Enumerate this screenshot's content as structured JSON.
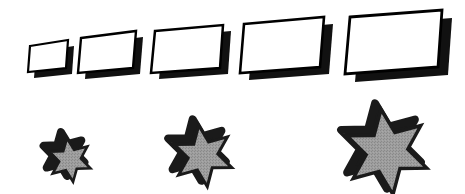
{
  "figure": {
    "background_color": "#ffffff",
    "width": 465,
    "height": 194,
    "outline_color": "#000000",
    "shadow_color": "#111111",
    "parallelogram_fill": "#ffffff",
    "star_fill": "#9a9a9a",
    "star_fill_texture": "#8d8d8d"
  },
  "rows": [
    {
      "name": "parallelogram-row",
      "label": "Row of five parallelograms",
      "shape_type": "parallelogram",
      "count": 5,
      "fill": "#ffffff",
      "stroke": "#000000",
      "shadow_offset_x": 7,
      "shadow_offset_y": 7,
      "shadow_direction": "down-right",
      "shapes": [
        {
          "name": "parallelogram-1",
          "index": 1,
          "size_label": "smallest",
          "center_x": 49,
          "center_y": 56,
          "width": 40,
          "height": 25,
          "slant": 9,
          "outline": "2",
          "points": "30,46 68,40 66,68 28,72"
        },
        {
          "name": "parallelogram-2",
          "index": 2,
          "size_label": "small",
          "center_x": 108,
          "center_y": 51,
          "width": 57,
          "height": 34,
          "slant": 11,
          "outline": "2",
          "points": "81,38 136,31 133,68 78,73"
        },
        {
          "name": "parallelogram-3",
          "index": 3,
          "size_label": "medium",
          "center_x": 187,
          "center_y": 48,
          "width": 71,
          "height": 40,
          "slant": 12,
          "outline": "2",
          "points": "155,31 223,25 220,68 151,73"
        },
        {
          "name": "parallelogram-4",
          "index": 4,
          "size_label": "large",
          "center_x": 280,
          "center_y": 45,
          "width": 83,
          "height": 48,
          "slant": 14,
          "outline": "2",
          "points": "244,24 324,17 320,67 240,73"
        },
        {
          "name": "parallelogram-5",
          "index": 5,
          "size_label": "largest",
          "center_x": 392,
          "center_y": 42,
          "width": 95,
          "height": 56,
          "slant": 16,
          "outline": "2",
          "points": "350,17 442,10 438,67 345,74"
        }
      ]
    },
    {
      "name": "star-row",
      "label": "Row of three six-pointed stars",
      "shape_type": "six-pointed-star",
      "count": 3,
      "fill": "#9a9a9a",
      "stroke": "#1a1a1a",
      "shadow_offset_x": -6,
      "shadow_offset_y": -6,
      "shadow_direction": "up-left",
      "shapes": [
        {
          "name": "star-1",
          "index": 1,
          "size_label": "small",
          "center_x": 70,
          "center_y": 160,
          "outer_radius": 22,
          "inner_radius": 11,
          "rotation": -8,
          "points": 6
        },
        {
          "name": "star-2",
          "index": 2,
          "size_label": "medium",
          "center_x": 203,
          "center_y": 156,
          "outer_radius": 31,
          "inner_radius": 15,
          "rotation": -8,
          "points": 6
        },
        {
          "name": "star-3",
          "index": 3,
          "size_label": "large",
          "center_x": 387,
          "center_y": 152,
          "outer_radius": 43,
          "inner_radius": 21,
          "rotation": -8,
          "points": 6
        }
      ]
    }
  ]
}
